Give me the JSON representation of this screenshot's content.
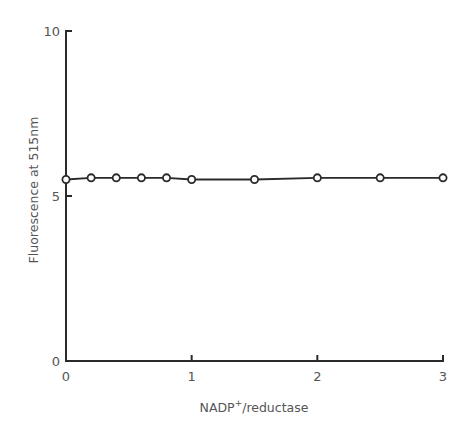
{
  "chart_data": {
    "type": "line",
    "title": "",
    "xlabel": "NADP⁺/reductase",
    "ylabel": "Fluorescence at 515nm",
    "x_ticks": [
      "0",
      "1",
      "2",
      "3"
    ],
    "y_ticks": [
      "0",
      "5",
      "10"
    ],
    "xlim": [
      0,
      3
    ],
    "ylim": [
      0,
      10
    ],
    "grid": false,
    "legend": null,
    "series": [
      {
        "name": "Fluorescence",
        "marker": "open-circle",
        "x": [
          0,
          0.2,
          0.4,
          0.6,
          0.8,
          1.0,
          1.5,
          2.0,
          2.5,
          3.0
        ],
        "y": [
          5.5,
          5.55,
          5.55,
          5.55,
          5.55,
          5.5,
          5.5,
          5.55,
          5.55,
          5.55
        ]
      }
    ]
  },
  "axes": {
    "x_label_main": "NADP",
    "x_label_sup": "+",
    "x_label_rest": "/reductase",
    "y_label": "Fluorescence at 515nm"
  },
  "colors": {
    "line": "#2a2a2a",
    "text": "#555555",
    "marker_fill": "#ffffff"
  }
}
